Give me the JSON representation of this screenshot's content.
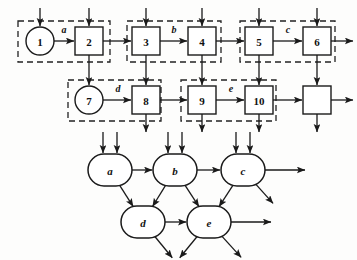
{
  "figure": {
    "background_color": "#fdfdfc",
    "stroke_color": "#1a1a1a",
    "dashed_color": "#222222"
  },
  "top_diagram": {
    "name": "petri-net-style-block-diagram",
    "row1": [
      {
        "id": "n1",
        "label": "1",
        "shape": "circle",
        "cx": 40,
        "cy": 41,
        "r": 14
      },
      {
        "id": "n2",
        "label": "2",
        "shape": "box",
        "cx": 89,
        "cy": 41,
        "w": 28,
        "h": 28
      },
      {
        "id": "n3",
        "label": "3",
        "shape": "box",
        "cx": 146,
        "cy": 41,
        "w": 28,
        "h": 28
      },
      {
        "id": "n4",
        "label": "4",
        "shape": "box",
        "cx": 202,
        "cy": 41,
        "w": 28,
        "h": 28
      },
      {
        "id": "n5",
        "label": "5",
        "shape": "box",
        "cx": 259,
        "cy": 41,
        "w": 28,
        "h": 28
      },
      {
        "id": "n6",
        "label": "6",
        "shape": "box",
        "cx": 317,
        "cy": 41,
        "w": 28,
        "h": 28
      }
    ],
    "row2": [
      {
        "id": "n7",
        "label": "7",
        "shape": "circle",
        "cx": 89,
        "cy": 100,
        "r": 14
      },
      {
        "id": "n8",
        "label": "8",
        "shape": "box",
        "cx": 146,
        "cy": 100,
        "w": 28,
        "h": 28
      },
      {
        "id": "n9",
        "label": "9",
        "shape": "box",
        "cx": 202,
        "cy": 100,
        "w": 28,
        "h": 28
      },
      {
        "id": "n10",
        "label": "10",
        "shape": "box",
        "cx": 259,
        "cy": 100,
        "w": 28,
        "h": 28
      },
      {
        "id": "n11",
        "label": "",
        "shape": "box",
        "cx": 317,
        "cy": 100,
        "w": 28,
        "h": 28
      }
    ],
    "edge_labels": [
      {
        "label": "a",
        "x": 64,
        "y": 33
      },
      {
        "label": "b",
        "x": 174,
        "y": 33
      },
      {
        "label": "c",
        "x": 288,
        "y": 33
      },
      {
        "label": "d",
        "x": 118,
        "y": 92
      },
      {
        "label": "e",
        "x": 231,
        "y": 92
      }
    ],
    "dashed_groups": [
      {
        "members": [
          "1",
          "2"
        ],
        "x": 18,
        "y": 21,
        "w": 92,
        "h": 41
      },
      {
        "members": [
          "3",
          "4"
        ],
        "x": 127,
        "y": 21,
        "w": 94,
        "h": 41
      },
      {
        "members": [
          "5",
          "6"
        ],
        "x": 240,
        "y": 21,
        "w": 95,
        "h": 41
      },
      {
        "members": [
          "7",
          "8"
        ],
        "x": 68,
        "y": 80,
        "w": 93,
        "h": 41
      },
      {
        "members": [
          "9",
          "10"
        ],
        "x": 181,
        "y": 80,
        "w": 95,
        "h": 41
      }
    ],
    "incoming_top_arrow_targets": [
      "1",
      "2",
      "3",
      "4",
      "5",
      "6"
    ],
    "vertical_links": [
      {
        "from": "2",
        "to": "7"
      },
      {
        "from": "3",
        "to": "8"
      },
      {
        "from": "4",
        "to": "9"
      },
      {
        "from": "5",
        "to": "10"
      },
      {
        "from": "6",
        "to": "unlabeled"
      }
    ],
    "outgoing_bottom_arrow_sources": [
      "8",
      "9",
      "10",
      "unlabeled"
    ],
    "outgoing_right_arrow_sources": [
      "6",
      "unlabeled"
    ]
  },
  "bottom_diagram": {
    "name": "reduced-stadium-node-graph",
    "nodes": [
      {
        "id": "a",
        "label": "a",
        "cx": 110,
        "cy": 170,
        "rx": 22,
        "ry": 16
      },
      {
        "id": "b",
        "label": "b",
        "cx": 175,
        "cy": 170,
        "rx": 22,
        "ry": 16
      },
      {
        "id": "c",
        "label": "c",
        "cx": 243,
        "cy": 170,
        "rx": 22,
        "ry": 16
      },
      {
        "id": "d",
        "label": "d",
        "cx": 143,
        "cy": 222,
        "rx": 22,
        "ry": 16
      },
      {
        "id": "e",
        "label": "e",
        "cx": 209,
        "cy": 222,
        "rx": 22,
        "ry": 16
      }
    ],
    "double_incoming_top": [
      "a",
      "b",
      "c"
    ],
    "edges": [
      {
        "from": "a",
        "to": "b"
      },
      {
        "from": "b",
        "to": "c"
      },
      {
        "from": "a",
        "to": "d"
      },
      {
        "from": "b",
        "to": "d"
      },
      {
        "from": "b",
        "to": "e"
      },
      {
        "from": "c",
        "to": "e"
      },
      {
        "from": "d",
        "to": "e"
      }
    ],
    "outgoing_right": [
      "c",
      "e"
    ],
    "outgoing_diagonal": [
      "c",
      "d",
      "e",
      "e"
    ]
  }
}
